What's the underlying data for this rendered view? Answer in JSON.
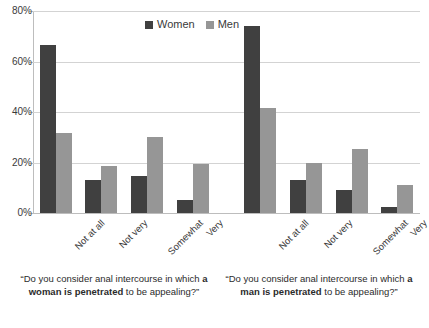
{
  "chart_data": {
    "type": "bar",
    "title": "",
    "xlabel": "",
    "ylabel": "",
    "ylim": [
      0,
      80
    ],
    "grid": true,
    "legend_position": "top-center",
    "ytick_labels": [
      "80%",
      "60%",
      "40%",
      "20%",
      "0%"
    ],
    "ytick_values": [
      80,
      60,
      40,
      20,
      0
    ],
    "categories": [
      "Not at all",
      "Not very",
      "Somewhat",
      "Very"
    ],
    "panels": [
      {
        "caption_prefix": "“Do you consider anal intercourse in which ",
        "caption_bold": "a woman is penetrated",
        "caption_suffix": " to be appealing?”",
        "categories": [
          "Not at all",
          "Not very",
          "Somewhat",
          "Very"
        ],
        "series": [
          {
            "name": "Women",
            "color": "#404040",
            "values": [
              66.5,
              13.0,
              14.5,
              5.0
            ]
          },
          {
            "name": "Men",
            "color": "#969696",
            "values": [
              31.5,
              18.8,
              30.0,
              19.5
            ]
          }
        ]
      },
      {
        "caption_prefix": "“Do you consider anal intercourse in which ",
        "caption_bold": "a man is penetrated",
        "caption_suffix": " to be appealing?”",
        "categories": [
          "Not at all",
          "Not very",
          "Somewhat",
          "Very"
        ],
        "series": [
          {
            "name": "Women",
            "color": "#404040",
            "values": [
              74.0,
              13.0,
              9.0,
              2.5
            ]
          },
          {
            "name": "Men",
            "color": "#969696",
            "values": [
              41.5,
              19.8,
              25.5,
              11.0
            ]
          }
        ]
      }
    ],
    "legend": [
      {
        "name": "Women",
        "color": "#404040"
      },
      {
        "name": "Men",
        "color": "#969696"
      }
    ]
  },
  "colors": {
    "women": "#404040",
    "men": "#969696",
    "grid": "#d3d3d3",
    "axis": "#bdbdbd",
    "text": "#3a3a3a",
    "background": "#ffffff"
  }
}
